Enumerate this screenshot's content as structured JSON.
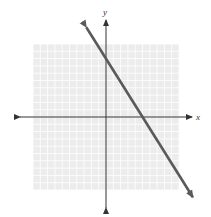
{
  "chart_data": {
    "type": "line",
    "title": "",
    "xlabel": "x",
    "ylabel": "y",
    "xlim": [
      -10,
      10
    ],
    "ylim": [
      -10,
      10
    ],
    "grid": true,
    "grid_step": 1,
    "tick_labels": false,
    "series": [
      {
        "name": "line",
        "equation": "y = -1.6x + 8",
        "slope": -1.6,
        "y_intercept": 8,
        "x_intercept": 5,
        "points": [
          [
            -2.7,
            12.3
          ],
          [
            0,
            8
          ],
          [
            5,
            0
          ],
          [
            11.9,
            -11
          ]
        ],
        "arrows_both_ends": true
      }
    ]
  },
  "colors": {
    "grid_background": "#ececec",
    "grid_lines": "#ffffff",
    "axes": "#333333",
    "line": "#5a5a5a"
  },
  "labels": {
    "x_axis": "x",
    "y_axis": "y"
  }
}
